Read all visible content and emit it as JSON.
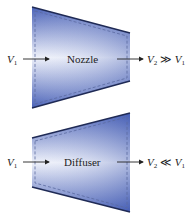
{
  "nozzle": {
    "label": "Nozzle",
    "inlet": {
      "symbol": "V",
      "sub": "1"
    },
    "outlet": {
      "symbol": "V",
      "sub": "2",
      "relation": "≫",
      "ref_symbol": "V",
      "ref_sub": "1"
    }
  },
  "diffuser": {
    "label": "Diffuser",
    "inlet": {
      "symbol": "V",
      "sub": "1"
    },
    "outlet": {
      "symbol": "V",
      "sub": "2",
      "relation": "≪",
      "ref_symbol": "V",
      "ref_sub": "1"
    }
  },
  "colors": {
    "fill_dark": "#4a62b8",
    "fill_light": "#eef1fa",
    "edge": "#1f2a55",
    "dash": "#5a6aa0",
    "arrow": "#222222"
  }
}
